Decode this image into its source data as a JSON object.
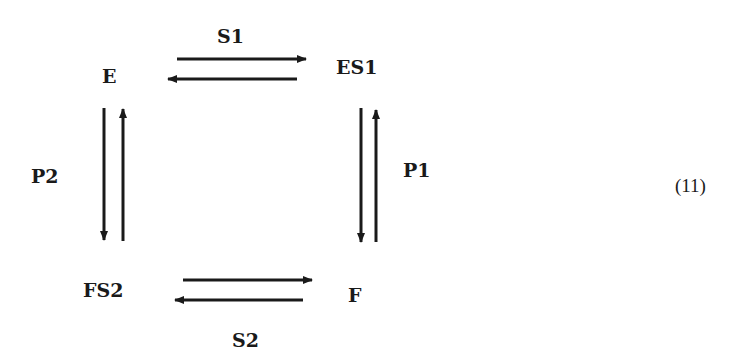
{
  "diagram": {
    "type": "reaction-cycle",
    "nodes": {
      "E": "E",
      "ES1": "ES1",
      "F": "F",
      "FS2": "FS2"
    },
    "edge_labels": {
      "S1": "S1",
      "P1": "P1",
      "S2": "S2",
      "P2": "P2"
    },
    "equation_number": "(11)",
    "edges": [
      {
        "from": "E",
        "to": "ES1",
        "label": "S1",
        "reversible": true
      },
      {
        "from": "ES1",
        "to": "F",
        "label": "P1",
        "reversible": true
      },
      {
        "from": "F",
        "to": "FS2",
        "label": "S2",
        "reversible": true
      },
      {
        "from": "FS2",
        "to": "E",
        "label": "P2",
        "reversible": true
      }
    ],
    "colors": {
      "stroke": "#1a1a1a",
      "background": "#ffffff"
    }
  }
}
